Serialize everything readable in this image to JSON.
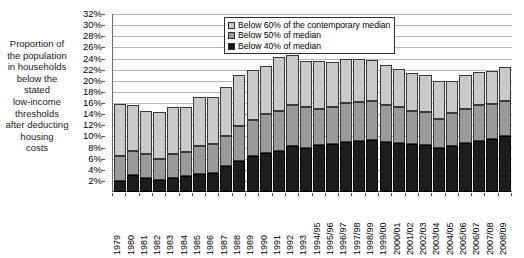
{
  "chart_data": {
    "type": "bar",
    "stacked": true,
    "title": "",
    "xlabel": "",
    "ylabel": "Proportion of the population in households below the stated low-income thresholds after deducting housing costs",
    "ylim": [
      0,
      32
    ],
    "ytick_step": 2,
    "grid": true,
    "legend_position": "top-right",
    "value_suffix": "%",
    "categories": [
      "1979",
      "1980",
      "1981",
      "1982",
      "1983",
      "1984",
      "1985",
      "1986",
      "1987",
      "1988",
      "1989",
      "1990",
      "1991",
      "1992",
      "1993",
      "1994/95",
      "1995/96",
      "1996/97",
      "1997/98",
      "1998/99",
      "1999/00",
      "2000/01",
      "2001/02",
      "2002/03",
      "2003/04",
      "2004/05",
      "2005/06",
      "2006/07",
      "2007/08",
      "2008/09"
    ],
    "ytick_labels": [
      "32%",
      "30%",
      "28%",
      "26%",
      "24%",
      "22%",
      "20%",
      "18%",
      "16%",
      "14%",
      "12%",
      "10%",
      "8%",
      "6%",
      "4%",
      "2%"
    ],
    "ytick_values": [
      32,
      30,
      28,
      26,
      24,
      22,
      20,
      18,
      16,
      14,
      12,
      10,
      8,
      6,
      4,
      2
    ],
    "series": [
      {
        "name": "Below 40% of median",
        "key": "below40",
        "color": "#1c1c1c",
        "values": [
          2.0,
          3.0,
          2.5,
          2.2,
          2.6,
          2.8,
          3.2,
          3.4,
          4.6,
          5.6,
          6.4,
          7.0,
          7.4,
          8.2,
          8.0,
          8.4,
          8.6,
          9.0,
          9.2,
          9.4,
          9.0,
          8.8,
          8.6,
          8.4,
          8.0,
          8.2,
          8.8,
          9.2,
          9.6,
          10.0
        ]
      },
      {
        "name": "Below 50% of median",
        "key": "below50",
        "color": "#9a9a9a",
        "values": [
          4.4,
          4.4,
          4.4,
          3.8,
          4.2,
          4.4,
          5.0,
          5.2,
          5.4,
          6.2,
          6.6,
          7.0,
          7.2,
          7.4,
          7.2,
          6.6,
          6.6,
          7.0,
          7.0,
          7.0,
          6.6,
          6.4,
          6.0,
          6.0,
          5.2,
          6.0,
          6.2,
          6.4,
          6.2,
          6.4
        ]
      },
      {
        "name": "Below 60% of the contemporary median",
        "key": "below60",
        "color": "#c9c9c9",
        "values": [
          9.4,
          8.2,
          7.6,
          8.4,
          8.4,
          8.0,
          8.8,
          8.4,
          8.8,
          9.2,
          9.0,
          8.6,
          9.6,
          9.0,
          8.4,
          8.6,
          8.2,
          8.0,
          7.8,
          7.4,
          7.2,
          7.0,
          6.8,
          6.6,
          6.8,
          5.8,
          6.0,
          6.0,
          6.0,
          6.0
        ]
      }
    ],
    "totals": [
      15.8,
      15.6,
      14.5,
      14.4,
      15.2,
      15.2,
      17.0,
      17.0,
      18.8,
      21.0,
      22.0,
      22.6,
      24.2,
      24.6,
      23.6,
      23.6,
      23.4,
      24.0,
      24.0,
      23.8,
      22.8,
      22.2,
      21.4,
      21.0,
      20.0,
      20.0,
      21.0,
      21.6,
      21.8,
      22.4
    ]
  },
  "legend": {
    "items": [
      {
        "label": "Below 60% of the contemporary median",
        "swatch": "sw60"
      },
      {
        "label": "Below 50% of median",
        "swatch": "sw50"
      },
      {
        "label": "Below 40% of median",
        "swatch": "sw40"
      }
    ]
  },
  "axis_title": {
    "lines": [
      "Proportion of",
      "the population",
      "in households",
      "below the",
      "stated",
      "low-income",
      "thresholds",
      "after deducting",
      "housing",
      "costs"
    ]
  },
  "colors": {
    "below60": "#c9c9c9",
    "below50": "#9a9a9a",
    "below40": "#1c1c1c",
    "gridline": "#b5b5b5",
    "axis": "#6b6b6b",
    "background": "#ffffff"
  }
}
